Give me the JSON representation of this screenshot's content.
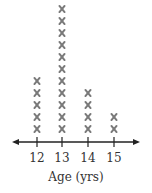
{
  "chart_data": {
    "type": "dot",
    "title": "",
    "xlabel": "Age (yrs)",
    "ylabel": "",
    "categories": [
      "12",
      "13",
      "14",
      "15"
    ],
    "values": [
      5,
      11,
      4,
      2
    ],
    "marker": "x",
    "marker_color": "#7a7a7a",
    "axis": {
      "arrows": "both",
      "grid": false
    },
    "legend": null
  }
}
